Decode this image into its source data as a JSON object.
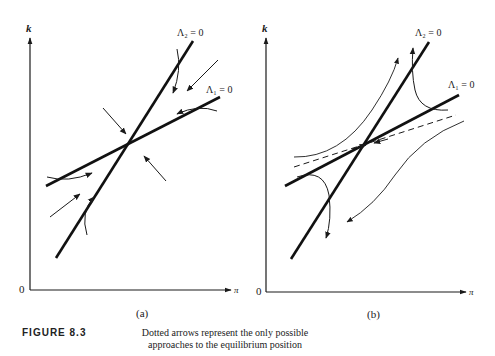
{
  "figure": {
    "label": "FIGURE 8.3",
    "caption_line1": "Dotted arrows represent the only possible",
    "caption_line2": "approaches to the equilibrium position"
  },
  "panels": [
    {
      "id": "a",
      "sublabel": "(a)",
      "y_axis_label": "k",
      "x_axis_label": "π",
      "origin_label": "0",
      "curves": [
        {
          "name": "Λ₂ = 0",
          "label": "Λ₂ = 0"
        },
        {
          "name": "Λ₁ = 0",
          "label": "Λ₁ = 0"
        }
      ],
      "description": "Stable node: all arrows point toward the equilibrium"
    },
    {
      "id": "b",
      "sublabel": "(b)",
      "y_axis_label": "k",
      "x_axis_label": "π",
      "origin_label": "0",
      "curves": [
        {
          "name": "Λ₂ = 0",
          "label": "Λ₂ = 0"
        },
        {
          "name": "Λ₁ = 0",
          "label": "Λ₁ = 0"
        }
      ],
      "description": "Saddle point: dashed stable arm, trajectories diverge"
    }
  ],
  "colors": {
    "ink": "#1a1a1a",
    "background": "#ffffff"
  }
}
